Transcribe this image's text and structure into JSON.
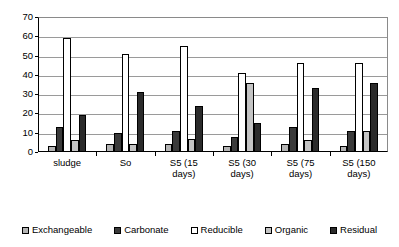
{
  "chart_data": {
    "type": "bar",
    "title": "",
    "subtitle": "",
    "xlabel": "",
    "ylabel": "",
    "ylim": [
      0,
      70
    ],
    "yticks": [
      0,
      10,
      20,
      30,
      40,
      50,
      60,
      70
    ],
    "grid": true,
    "legend_position": "bottom",
    "categories": [
      "sludge",
      "So",
      "S5 (15 days)",
      "S5 (30 days)",
      "S5 (75 days)",
      "S5 (150 days)"
    ],
    "category_lines": [
      [
        "sludge"
      ],
      [
        "So"
      ],
      [
        "S5 (15",
        "days)"
      ],
      [
        "S5 (30",
        "days)"
      ],
      [
        "S5 (75",
        "days)"
      ],
      [
        "S5 (150",
        "days)"
      ]
    ],
    "series": [
      {
        "name": "Exchangeable",
        "color": "#b4b4b4",
        "values": [
          3,
          4,
          4,
          3,
          4,
          3
        ]
      },
      {
        "name": "Carbonate",
        "color": "#3a3a3a",
        "values": [
          13,
          10,
          11,
          8,
          13,
          11
        ]
      },
      {
        "name": "Reducible",
        "color": "#ffffff",
        "values": [
          59,
          51,
          55,
          41,
          46,
          46
        ]
      },
      {
        "name": "Organic",
        "color": "#c4c4c4",
        "values": [
          6,
          4,
          7,
          36,
          6,
          11
        ]
      },
      {
        "name": "Residual",
        "color": "#2b2b2b",
        "values": [
          19,
          31,
          24,
          15,
          33,
          36
        ]
      }
    ]
  },
  "legend": {
    "items": [
      {
        "label": "Exchangeable"
      },
      {
        "label": "Carbonate"
      },
      {
        "label": "Reducible"
      },
      {
        "label": "Organic"
      },
      {
        "label": "Residual"
      }
    ]
  }
}
